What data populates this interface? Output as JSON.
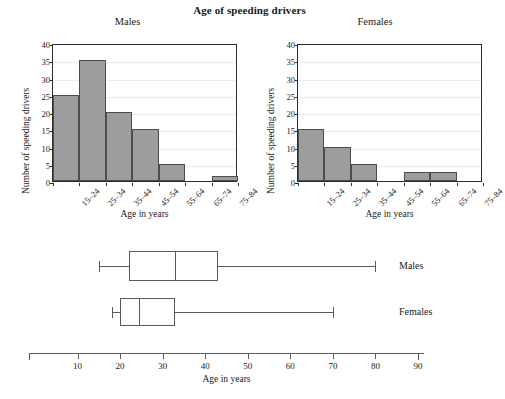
{
  "figure": {
    "title": "Age of speeding drivers",
    "axis_label_x": "Age in years",
    "axis_label_y": "Number of speeding drivers"
  },
  "chart_data": [
    {
      "type": "bar",
      "title": "Males",
      "xlabel": "Age in years",
      "ylabel": "Number of speeding drivers",
      "categories": [
        "15–24",
        "25–34",
        "35–44",
        "45–54",
        "55–64",
        "65–74",
        "75–84"
      ],
      "values": [
        25,
        35,
        20,
        15,
        5,
        0,
        1.5
      ],
      "ylim": [
        0,
        40
      ],
      "yticks": [
        0,
        5,
        10,
        15,
        20,
        25,
        30,
        35,
        40
      ],
      "grid": true,
      "legend": "none",
      "bar_color": "#9d9d9d",
      "bar_edge_color": "#4d4d4d"
    },
    {
      "type": "bar",
      "title": "Females",
      "xlabel": "Age in years",
      "ylabel": "Number of speeding drivers",
      "categories": [
        "15–24",
        "25–34",
        "35–44",
        "45–54",
        "55–64",
        "65–74",
        "75–84"
      ],
      "values": [
        15,
        10,
        5,
        0,
        2.5,
        2.5,
        0
      ],
      "ylim": [
        0,
        40
      ],
      "yticks": [
        0,
        5,
        10,
        15,
        20,
        25,
        30,
        35,
        40
      ],
      "grid": true,
      "legend": "none",
      "bar_color": "#9d9d9d",
      "bar_edge_color": "#4d4d4d"
    },
    {
      "type": "boxplot",
      "title": "",
      "xlabel": "Age in years",
      "orientation": "horizontal",
      "xlim": [
        0,
        90
      ],
      "xticks": [
        10,
        20,
        30,
        40,
        50,
        60,
        70,
        80,
        90
      ],
      "groups": [
        {
          "name": "Males",
          "min": 15,
          "q1": 22,
          "median": 33,
          "q3": 43,
          "max": 80
        },
        {
          "name": "Females",
          "min": 18,
          "q1": 20,
          "median": 24.5,
          "q3": 33,
          "max": 70
        }
      ]
    }
  ]
}
